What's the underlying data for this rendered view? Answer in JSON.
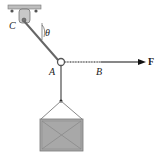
{
  "figure": {
    "labels": {
      "C": "C",
      "theta": "θ",
      "A": "A",
      "B": "B",
      "F": "F"
    },
    "colors": {
      "cable": "#666666",
      "crate_fill": "#a8a8a8",
      "support": "#999999",
      "force": "#111111"
    }
  }
}
